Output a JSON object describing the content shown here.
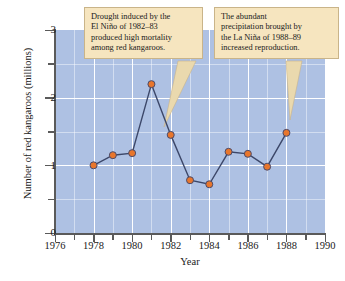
{
  "chart_data": {
    "type": "line",
    "title": "",
    "xlabel": "Year",
    "ylabel": "Number of red kangaroos (millions)",
    "xlim": [
      1976,
      1990
    ],
    "ylim": [
      0,
      3
    ],
    "x_major_ticks": [
      1976,
      1978,
      1980,
      1982,
      1984,
      1986,
      1988,
      1990
    ],
    "x_minor_ticks": [
      1977,
      1979,
      1981,
      1983,
      1985,
      1987,
      1989
    ],
    "y_major_ticks": [
      0,
      1,
      2,
      3
    ],
    "y_minor_ticks": [
      0.5,
      1.5,
      2.5
    ],
    "grid": true,
    "legend": "none",
    "series": [
      {
        "name": "Red kangaroo population",
        "x": [
          1978,
          1979,
          1980,
          1981,
          1982,
          1983,
          1984,
          1985,
          1986,
          1987,
          1988
        ],
        "values": [
          1.0,
          1.15,
          1.18,
          2.2,
          1.45,
          0.78,
          0.72,
          1.2,
          1.17,
          0.98,
          1.48
        ],
        "marker": "circle",
        "marker_fill": "#e8762c",
        "marker_edge": "#4a4a6a",
        "line_color": "#3c4769"
      }
    ],
    "annotations": [
      {
        "name": "drought-callout",
        "text": "Drought induced by the El Niño of 1982–83 produced high mortality among red kangaroos.",
        "lines": [
          "Drought induced by the",
          "El Niño of 1982–83",
          "produced high mortality",
          "among red kangaroos."
        ],
        "points_to_year": 1983
      },
      {
        "name": "precipitation-callout",
        "text": "The abundant precipitation brought by the La Niña of 1988–89 increased reproduction.",
        "lines": [
          "The abundant",
          "precipitation brought by",
          "the La Niña of 1988–89",
          "increased reproduction."
        ],
        "points_to_year": 1988
      }
    ],
    "colors": {
      "plot_background": "#aec1e3",
      "gridline": "#ffffff",
      "axis": "#5a5a5a",
      "callout_fill": "#f6e5bf",
      "callout_border": "#c9b489",
      "marker_fill": "#e8762c",
      "line": "#3c4769"
    }
  },
  "axes": {
    "y_tick_labels": [
      "0",
      "1",
      "2",
      "3"
    ],
    "x_tick_labels": [
      "1976",
      "1978",
      "1980",
      "1982",
      "1984",
      "1986",
      "1988",
      "1990"
    ],
    "y_title": "Number of red kangaroos (millions)",
    "x_title": "Year"
  }
}
